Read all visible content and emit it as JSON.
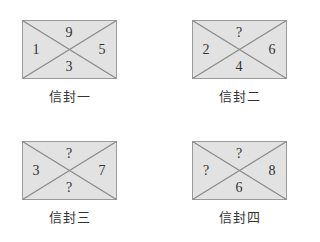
{
  "colors": {
    "envelope_fill": "#e2e2e2",
    "envelope_stroke": "#8a8a8a",
    "text": "#333333"
  },
  "envelopes": [
    {
      "label": "信封一",
      "top": "9",
      "left": "1",
      "right": "5",
      "bottom": "3"
    },
    {
      "label": "信封二",
      "top": "?",
      "left": "2",
      "right": "6",
      "bottom": "4"
    },
    {
      "label": "信封三",
      "top": "?",
      "left": "3",
      "right": "7",
      "bottom": "?"
    },
    {
      "label": "信封四",
      "top": "?",
      "left": "?",
      "right": "8",
      "bottom": "6"
    }
  ]
}
